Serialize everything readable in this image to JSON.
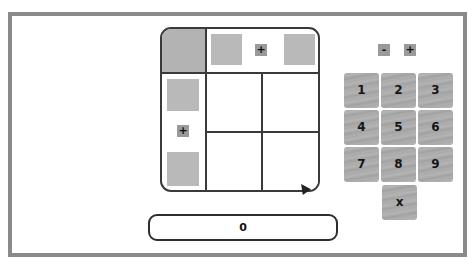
{
  "grid": {
    "top_plus_label": "+",
    "left_plus_label": "+"
  },
  "controls": {
    "minus_label": "-",
    "plus_label": "+"
  },
  "keypad": {
    "keys": [
      "1",
      "2",
      "3",
      "4",
      "5",
      "6",
      "7",
      "8",
      "9",
      "x"
    ]
  },
  "display": {
    "value": "0"
  },
  "colors": {
    "frame_border": "#8a8a8a",
    "tile_gray": "#b9b9b9",
    "grid_line": "#3a3a3a"
  }
}
